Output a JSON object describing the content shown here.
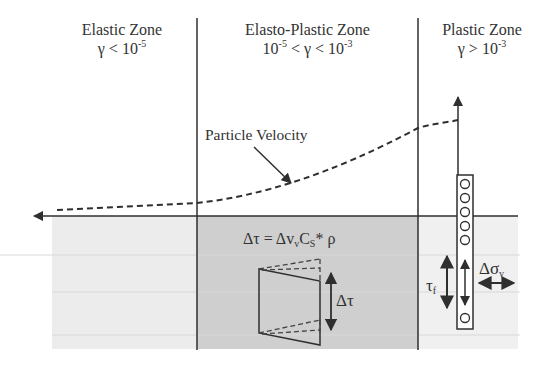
{
  "zones": [
    {
      "title": "Elastic Zone",
      "condition_prefix": "γ < 10",
      "condition_exp": "-5",
      "condition_suffix": ""
    },
    {
      "title": "Elasto-Plastic Zone",
      "condition_prefix": "10",
      "condition_exp": "-5",
      "condition_suffix": " < γ < 10",
      "condition_exp2": "-3"
    },
    {
      "title": "Plastic Zone",
      "condition_prefix": "γ > 10",
      "condition_exp": "-3",
      "condition_suffix": ""
    }
  ],
  "labels": {
    "particle_velocity": "Particle Velocity",
    "equation_lhs": "Δτ = Δv",
    "equation_sub_v": "v",
    "equation_c": "C",
    "equation_sub_s": "S",
    "equation_rest": "* ρ",
    "delta_tau": "Δτ",
    "tau_f": "τ",
    "tau_f_sub": "f",
    "delta_sigma": "Δσ",
    "delta_sigma_sub": "v"
  },
  "colors": {
    "ground_light": "#ececec",
    "ground_dark": "#cfcfcf",
    "line": "#2f2f2f"
  }
}
